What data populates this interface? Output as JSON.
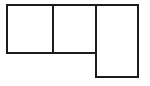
{
  "figure": {
    "type": "line-drawing",
    "canvas": {
      "width": 150,
      "height": 86
    },
    "background_color": "#ffffff",
    "stroke_color": "#1b1b1b",
    "fill_color": "#ffffff",
    "stroke_width": 2
  },
  "geometry": {
    "outline_name": "l-shape-outline",
    "outline_points": "7,5 138,5 138,77 96,77 96,53 7,53",
    "cells": [
      {
        "name": "cell-left",
        "label": "",
        "x": 7,
        "y": 5,
        "width": 46,
        "height": 48
      },
      {
        "name": "cell-middle",
        "label": "",
        "x": 53,
        "y": 5,
        "width": 43,
        "height": 48
      },
      {
        "name": "cell-right",
        "label": "",
        "x": 96,
        "y": 5,
        "width": 42,
        "height": 72
      }
    ],
    "dividers": [
      {
        "name": "divider-vertical-left",
        "orientation": "vertical",
        "x1": 53,
        "y1": 5,
        "x2": 53,
        "y2": 53
      },
      {
        "name": "divider-vertical-right",
        "orientation": "vertical",
        "x1": 96,
        "y1": 5,
        "x2": 96,
        "y2": 77
      },
      {
        "name": "divider-horizontal-bottom",
        "orientation": "horizontal",
        "x1": 7,
        "y1": 53,
        "x2": 96,
        "y2": 53
      }
    ]
  },
  "labels": {
    "none_visible": ""
  }
}
